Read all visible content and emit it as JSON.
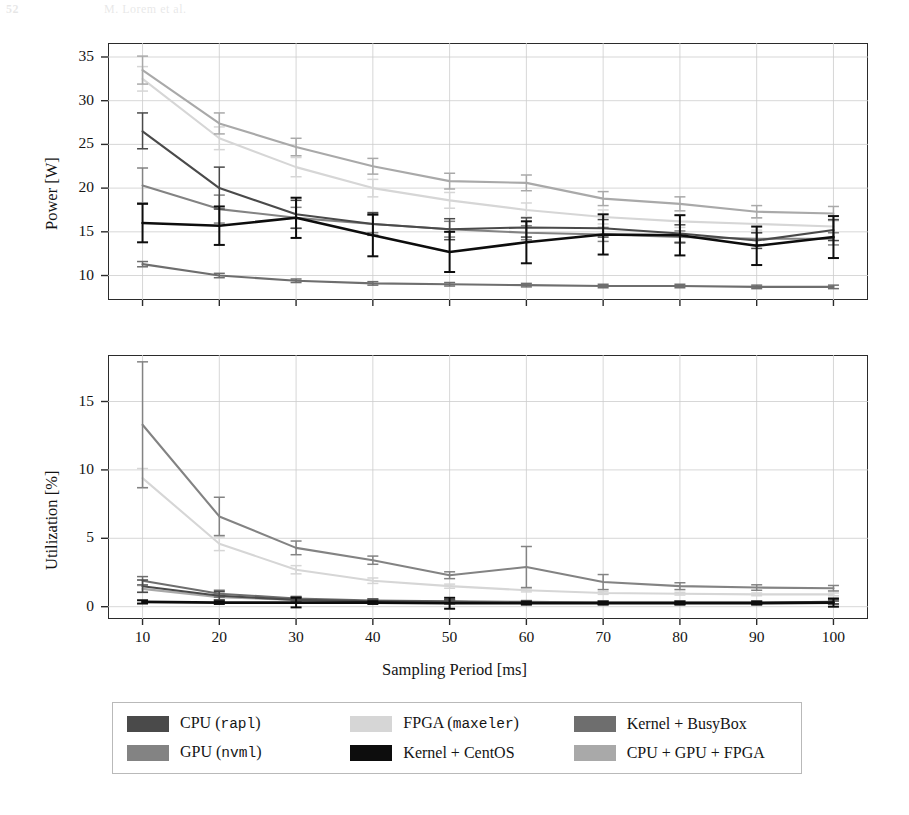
{
  "running_head": {
    "page_number": "52",
    "text": "M. Lorem et al."
  },
  "figure": {
    "xlabel": "Sampling Period [ms]",
    "x_ticks": [
      10,
      20,
      30,
      40,
      50,
      60,
      70,
      80,
      90,
      100
    ]
  },
  "legend": {
    "items": [
      {
        "label_main": "CPU (",
        "label_mono": "rapl",
        "label_tail": ")",
        "name": "CPU (rapl)",
        "color": "#4a4a4a"
      },
      {
        "label_main": "GPU (",
        "label_mono": "nvml",
        "label_tail": ")",
        "name": "GPU (nvml)",
        "color": "#838383"
      },
      {
        "label_main": "FPGA (",
        "label_mono": "maxeler",
        "label_tail": ")",
        "name": "FPGA (maxeler)",
        "color": "#d6d6d6"
      },
      {
        "label_main": "Kernel + CentOS",
        "label_mono": "",
        "label_tail": "",
        "name": "Kernel + CentOS",
        "color": "#0d0d0d"
      },
      {
        "label_main": "Kernel + BusyBox",
        "label_mono": "",
        "label_tail": "",
        "name": "Kernel + BusyBox",
        "color": "#6e6e6e"
      },
      {
        "label_main": "CPU + GPU + FPGA",
        "label_mono": "",
        "label_tail": "",
        "name": "CPU + GPU + FPGA",
        "color": "#a9a9a9"
      }
    ]
  },
  "chart_data": [
    {
      "type": "line",
      "title": "",
      "panel": "top",
      "xlabel": "Sampling Period [ms]",
      "ylabel": "Power [W]",
      "x": [
        10,
        20,
        30,
        40,
        50,
        60,
        70,
        80,
        90,
        100
      ],
      "xlim": [
        5.5,
        104.5
      ],
      "ylim": [
        7.2,
        36.6
      ],
      "y_ticks": [
        10,
        15,
        20,
        25,
        30,
        35
      ],
      "grid": true,
      "error_bars": true,
      "legend_position": "below-figure",
      "series": [
        {
          "name": "CPU (rapl)",
          "color": "#4a4a4a",
          "values": [
            26.5,
            20.0,
            17.0,
            15.9,
            15.3,
            15.5,
            15.4,
            14.8,
            14.0,
            15.2
          ],
          "err_low": [
            2.0,
            2.4,
            1.6,
            1.3,
            1.2,
            1.1,
            1.0,
            1.0,
            0.9,
            1.2
          ],
          "err_high": [
            2.1,
            2.4,
            1.6,
            1.3,
            1.2,
            1.1,
            1.0,
            1.0,
            0.9,
            1.2
          ]
        },
        {
          "name": "GPU (nvml)",
          "color": "#838383",
          "values": [
            20.3,
            17.6,
            16.6,
            15.9,
            15.3,
            14.9,
            14.7,
            14.4,
            14.2,
            14.2
          ],
          "err_low": [
            2.0,
            1.6,
            1.2,
            1.0,
            0.9,
            0.8,
            0.8,
            0.7,
            0.7,
            0.7
          ],
          "err_high": [
            2.0,
            1.6,
            1.2,
            1.0,
            0.9,
            0.8,
            0.8,
            0.7,
            0.7,
            0.7
          ]
        },
        {
          "name": "FPGA (maxeler)",
          "color": "#d6d6d6",
          "values": [
            32.5,
            25.7,
            22.4,
            20.0,
            18.6,
            17.5,
            16.7,
            16.2,
            15.9,
            15.6
          ],
          "err_low": [
            1.4,
            1.3,
            1.1,
            1.0,
            0.9,
            0.8,
            0.8,
            0.7,
            0.7,
            0.7
          ],
          "err_high": [
            1.4,
            1.3,
            1.1,
            1.0,
            0.9,
            0.8,
            0.8,
            0.7,
            0.7,
            0.7
          ]
        },
        {
          "name": "Kernel + CentOS",
          "color": "#0d0d0d",
          "values": [
            16.0,
            15.7,
            16.6,
            14.6,
            12.7,
            13.8,
            14.7,
            14.6,
            13.4,
            14.4
          ],
          "err_low": [
            2.2,
            2.2,
            2.3,
            2.4,
            2.3,
            2.4,
            2.3,
            2.3,
            2.2,
            2.4
          ],
          "err_high": [
            2.2,
            2.2,
            2.3,
            2.4,
            2.3,
            2.4,
            2.3,
            2.3,
            2.2,
            2.4
          ]
        },
        {
          "name": "Kernel + BusyBox",
          "color": "#6e6e6e",
          "values": [
            11.3,
            10.0,
            9.4,
            9.1,
            9.0,
            8.9,
            8.8,
            8.8,
            8.7,
            8.7
          ],
          "err_low": [
            0.3,
            0.25,
            0.2,
            0.2,
            0.2,
            0.2,
            0.2,
            0.2,
            0.2,
            0.2
          ],
          "err_high": [
            0.3,
            0.25,
            0.2,
            0.2,
            0.2,
            0.2,
            0.2,
            0.2,
            0.2,
            0.2
          ]
        },
        {
          "name": "CPU + GPU + FPGA",
          "color": "#a9a9a9",
          "values": [
            33.5,
            27.4,
            24.7,
            22.5,
            20.8,
            20.6,
            18.8,
            18.2,
            17.3,
            17.1
          ],
          "err_low": [
            1.6,
            1.2,
            1.0,
            0.9,
            0.9,
            0.9,
            0.8,
            0.8,
            0.7,
            0.8
          ],
          "err_high": [
            1.6,
            1.2,
            1.0,
            0.9,
            0.9,
            0.9,
            0.8,
            0.8,
            0.7,
            0.8
          ]
        }
      ]
    },
    {
      "type": "line",
      "title": "",
      "panel": "bottom",
      "xlabel": "Sampling Period [ms]",
      "ylabel": "Utilization [%]",
      "x": [
        10,
        20,
        30,
        40,
        50,
        60,
        70,
        80,
        90,
        100
      ],
      "xlim": [
        5.5,
        104.5
      ],
      "ylim": [
        -0.9,
        18.4
      ],
      "y_ticks": [
        0,
        5,
        10,
        15
      ],
      "grid": true,
      "error_bars": true,
      "legend_position": "below-figure",
      "series": [
        {
          "name": "CPU (rapl)",
          "color": "#4a4a4a",
          "values": [
            1.5,
            0.8,
            0.5,
            0.4,
            0.35,
            0.3,
            0.3,
            0.3,
            0.3,
            0.35
          ],
          "err_low": [
            0.45,
            0.3,
            0.2,
            0.15,
            0.15,
            0.12,
            0.12,
            0.12,
            0.12,
            0.15
          ],
          "err_high": [
            0.45,
            0.3,
            0.2,
            0.15,
            0.15,
            0.12,
            0.12,
            0.12,
            0.12,
            0.15
          ]
        },
        {
          "name": "GPU (nvml)",
          "color": "#838383",
          "values": [
            13.3,
            6.6,
            4.3,
            3.4,
            2.3,
            2.9,
            1.8,
            1.5,
            1.4,
            1.35
          ],
          "err_low": [
            4.6,
            1.4,
            0.5,
            0.3,
            0.25,
            1.5,
            0.55,
            0.25,
            0.2,
            0.2
          ],
          "err_high": [
            4.6,
            1.4,
            0.5,
            0.3,
            0.25,
            1.5,
            0.55,
            0.25,
            0.2,
            0.2
          ]
        },
        {
          "name": "FPGA (maxeler)",
          "color": "#d6d6d6",
          "values": [
            9.4,
            4.6,
            2.7,
            1.9,
            1.5,
            1.2,
            1.0,
            0.95,
            0.9,
            0.9
          ],
          "err_low": [
            0.7,
            0.5,
            0.3,
            0.2,
            0.15,
            0.12,
            0.1,
            0.1,
            0.1,
            0.1
          ],
          "err_high": [
            0.7,
            0.5,
            0.3,
            0.2,
            0.15,
            0.12,
            0.1,
            0.1,
            0.1,
            0.1
          ]
        },
        {
          "name": "Kernel + CentOS",
          "color": "#0d0d0d",
          "values": [
            0.35,
            0.3,
            0.3,
            0.3,
            0.25,
            0.25,
            0.25,
            0.25,
            0.25,
            0.3
          ],
          "err_low": [
            0.12,
            0.1,
            0.35,
            0.1,
            0.4,
            0.1,
            0.1,
            0.1,
            0.1,
            0.3
          ],
          "err_high": [
            0.12,
            0.1,
            0.35,
            0.1,
            0.4,
            0.1,
            0.1,
            0.1,
            0.1,
            0.3
          ]
        },
        {
          "name": "Kernel + BusyBox",
          "color": "#6e6e6e",
          "values": [
            1.9,
            0.95,
            0.6,
            0.45,
            0.4,
            0.35,
            0.3,
            0.3,
            0.3,
            0.3
          ],
          "err_low": [
            0.3,
            0.25,
            0.15,
            0.12,
            0.1,
            0.1,
            0.1,
            0.1,
            0.1,
            0.1
          ],
          "err_high": [
            0.3,
            0.25,
            0.15,
            0.12,
            0.1,
            0.1,
            0.1,
            0.1,
            0.1,
            0.1
          ]
        },
        {
          "name": "CPU + GPU + FPGA",
          "color": "#a9a9a9",
          "values": [
            1.3,
            0.7,
            0.5,
            0.4,
            0.35,
            0.3,
            0.3,
            0.3,
            0.3,
            0.3
          ],
          "err_low": [
            0.25,
            0.2,
            0.12,
            0.1,
            0.1,
            0.1,
            0.1,
            0.1,
            0.1,
            0.1
          ],
          "err_high": [
            0.25,
            0.2,
            0.12,
            0.1,
            0.1,
            0.1,
            0.1,
            0.1,
            0.1,
            0.1
          ]
        }
      ]
    }
  ]
}
